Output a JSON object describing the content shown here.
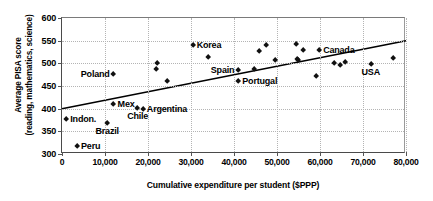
{
  "chart_data": {
    "type": "scatter",
    "title": "",
    "xlabel": "Cumulative expenditure per student ($PPP)",
    "ylabel": "Average PISA score (reading, mathematics, science)",
    "ylabel_line1": "Average PISA score",
    "ylabel_line2": "(reading, mathematics, science)",
    "xlim": [
      0,
      80000
    ],
    "ylim": [
      300,
      600
    ],
    "xticks": [
      0,
      10000,
      20000,
      30000,
      40000,
      50000,
      60000,
      70000,
      80000
    ],
    "xticklabels": [
      "0",
      "10,000",
      "20,000",
      "30,000",
      "40,000",
      "50,000",
      "60,000",
      "70,000",
      "80,000"
    ],
    "yticks": [
      300,
      350,
      400,
      450,
      500,
      550,
      600
    ],
    "yticklabels": [
      "300",
      "350",
      "400",
      "450",
      "500",
      "550",
      "600"
    ],
    "grid": true,
    "legend": "none",
    "marker": "diamond",
    "marker_color": "#111111",
    "points": [
      {
        "x": 1000,
        "y": 377,
        "label": "Indon.",
        "label_pos": "right"
      },
      {
        "x": 3500,
        "y": 318,
        "label": "Peru",
        "label_pos": "right"
      },
      {
        "x": 10500,
        "y": 368,
        "label": "Brazil",
        "label_pos": "below"
      },
      {
        "x": 12000,
        "y": 410,
        "label": "Mex",
        "label_pos": "right"
      },
      {
        "x": 12000,
        "y": 477,
        "label": "Poland",
        "label_pos": "left"
      },
      {
        "x": 17600,
        "y": 401,
        "label": "Chile",
        "label_pos": "below"
      },
      {
        "x": 18800,
        "y": 399,
        "label": "Argentina",
        "label_pos": "right"
      },
      {
        "x": 22000,
        "y": 488,
        "label": "",
        "label_pos": "none"
      },
      {
        "x": 22200,
        "y": 500,
        "label": "",
        "label_pos": "none"
      },
      {
        "x": 24400,
        "y": 460,
        "label": "",
        "label_pos": "none"
      },
      {
        "x": 30400,
        "y": 541,
        "label": "Korea",
        "label_pos": "right"
      },
      {
        "x": 34000,
        "y": 513,
        "label": "",
        "label_pos": "none"
      },
      {
        "x": 41000,
        "y": 485,
        "label": "Spain",
        "label_pos": "left"
      },
      {
        "x": 41000,
        "y": 460,
        "label": "Portugal",
        "label_pos": "right"
      },
      {
        "x": 44600,
        "y": 488,
        "label": "",
        "label_pos": "none"
      },
      {
        "x": 45800,
        "y": 527,
        "label": "",
        "label_pos": "none"
      },
      {
        "x": 47600,
        "y": 539,
        "label": "",
        "label_pos": "none"
      },
      {
        "x": 49600,
        "y": 506,
        "label": "",
        "label_pos": "none"
      },
      {
        "x": 54400,
        "y": 542,
        "label": "",
        "label_pos": "none"
      },
      {
        "x": 54600,
        "y": 510,
        "label": "",
        "label_pos": "none"
      },
      {
        "x": 55000,
        "y": 506,
        "label": "",
        "label_pos": "none"
      },
      {
        "x": 56000,
        "y": 528,
        "label": "",
        "label_pos": "none"
      },
      {
        "x": 59200,
        "y": 472,
        "label": "",
        "label_pos": "none"
      },
      {
        "x": 59800,
        "y": 530,
        "label": "Canada",
        "label_pos": "right"
      },
      {
        "x": 63200,
        "y": 500,
        "label": "",
        "label_pos": "none"
      },
      {
        "x": 64800,
        "y": 496,
        "label": "",
        "label_pos": "none"
      },
      {
        "x": 65800,
        "y": 503,
        "label": "",
        "label_pos": "none"
      },
      {
        "x": 71800,
        "y": 498,
        "label": "USA",
        "label_pos": "below"
      },
      {
        "x": 77000,
        "y": 512,
        "label": "",
        "label_pos": "none"
      }
    ],
    "trendline": {
      "type": "linear",
      "x_start": 0,
      "y_start": 400,
      "x_end": 80000,
      "y_end": 550,
      "color": "#000000"
    }
  }
}
